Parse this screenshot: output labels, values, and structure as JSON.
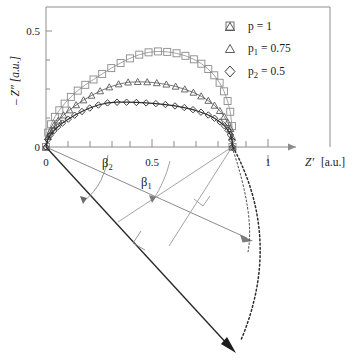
{
  "figure": {
    "kind": "cole-cole-impedance-plot-with-angle-construction",
    "background": "#ffffff"
  },
  "axes": {
    "x": {
      "title": "Z′",
      "unit": "[a.u.]",
      "tick_labels": [
        "0",
        "0.5",
        "1"
      ],
      "tick_values": [
        0,
        0.5,
        1
      ],
      "minor_ticks": [
        0.1,
        0.2,
        0.3,
        0.4,
        0.6,
        0.7,
        0.8,
        0.9,
        1.1,
        1.2
      ],
      "range": [
        0,
        1.28
      ],
      "arrow": true
    },
    "y": {
      "title": "– Z″",
      "unit": "[a.u.]",
      "label": "– Z″ [a.u.]",
      "tick_labels": [
        "0",
        "0.5"
      ],
      "tick_values": [
        0,
        0.5
      ],
      "range": [
        0,
        0.605
      ]
    },
    "frame_color": "#8c8c8c"
  },
  "legend": {
    "position": "top-right-inside",
    "items": [
      {
        "marker": "square",
        "label": "p = 1",
        "base": "p",
        "sub": "",
        "value": "1",
        "color": "#6e6e6e"
      },
      {
        "marker": "triangle",
        "label": "p1 = 0.75",
        "base": "p",
        "sub": "1",
        "value": "0.75",
        "color": "#5a5a5a"
      },
      {
        "marker": "diamond",
        "label": "p2 = 0.5",
        "base": "p",
        "sub": "2",
        "value": "0.5",
        "color": "#3a3a3a"
      }
    ]
  },
  "annotations": {
    "beta1": {
      "text": "β",
      "sub": "1"
    },
    "beta2": {
      "text": "β",
      "sub": "2"
    }
  },
  "chart_data": {
    "type": "scatter",
    "title": "",
    "xlabel": "Z′ [a.u.]",
    "ylabel": "– Z″ [a.u.]",
    "xlim": [
      0,
      1.28
    ],
    "ylim": [
      0,
      0.605
    ],
    "grid": false,
    "legend_position": "upper right",
    "series": [
      {
        "name": "p = 1",
        "marker": "square",
        "peak": 0.41,
        "x_end": 0.84,
        "x": [
          0.0,
          0.01,
          0.023,
          0.04,
          0.06,
          0.084,
          0.112,
          0.143,
          0.177,
          0.214,
          0.253,
          0.294,
          0.336,
          0.378,
          0.42,
          0.462,
          0.504,
          0.546,
          0.588,
          0.628,
          0.666,
          0.7,
          0.731,
          0.758,
          0.782,
          0.802,
          0.818,
          0.83,
          0.838,
          0.84
        ],
        "y": [
          0.0,
          0.062,
          0.098,
          0.13,
          0.158,
          0.187,
          0.216,
          0.243,
          0.268,
          0.291,
          0.315,
          0.34,
          0.362,
          0.382,
          0.398,
          0.408,
          0.412,
          0.41,
          0.404,
          0.393,
          0.378,
          0.359,
          0.336,
          0.309,
          0.277,
          0.24,
          0.198,
          0.152,
          0.09,
          0.0
        ]
      },
      {
        "name": "p1 = 0.75",
        "marker": "triangle",
        "peak": 0.281,
        "x_end": 0.84,
        "x": [
          0.0,
          0.009,
          0.021,
          0.037,
          0.056,
          0.079,
          0.106,
          0.136,
          0.169,
          0.205,
          0.244,
          0.285,
          0.327,
          0.37,
          0.413,
          0.456,
          0.499,
          0.542,
          0.584,
          0.625,
          0.664,
          0.699,
          0.731,
          0.759,
          0.783,
          0.803,
          0.819,
          0.831,
          0.838,
          0.84
        ],
        "y": [
          0.0,
          0.044,
          0.07,
          0.094,
          0.115,
          0.137,
          0.159,
          0.181,
          0.202,
          0.222,
          0.241,
          0.258,
          0.271,
          0.279,
          0.281,
          0.28,
          0.276,
          0.27,
          0.261,
          0.249,
          0.235,
          0.219,
          0.2,
          0.179,
          0.156,
          0.131,
          0.105,
          0.078,
          0.043,
          0.0
        ]
      },
      {
        "name": "p2 = 0.5",
        "marker": "diamond",
        "peak": 0.193,
        "x_end": 0.84,
        "x": [
          0.0,
          0.008,
          0.019,
          0.034,
          0.052,
          0.074,
          0.1,
          0.129,
          0.162,
          0.197,
          0.236,
          0.277,
          0.32,
          0.363,
          0.407,
          0.451,
          0.495,
          0.538,
          0.581,
          0.623,
          0.662,
          0.698,
          0.731,
          0.759,
          0.784,
          0.804,
          0.82,
          0.831,
          0.838,
          0.84
        ],
        "y": [
          0.0,
          0.032,
          0.051,
          0.069,
          0.086,
          0.103,
          0.12,
          0.137,
          0.153,
          0.168,
          0.181,
          0.19,
          0.193,
          0.193,
          0.192,
          0.19,
          0.187,
          0.183,
          0.177,
          0.17,
          0.161,
          0.15,
          0.138,
          0.124,
          0.108,
          0.091,
          0.072,
          0.052,
          0.029,
          0.0
        ]
      }
    ]
  }
}
